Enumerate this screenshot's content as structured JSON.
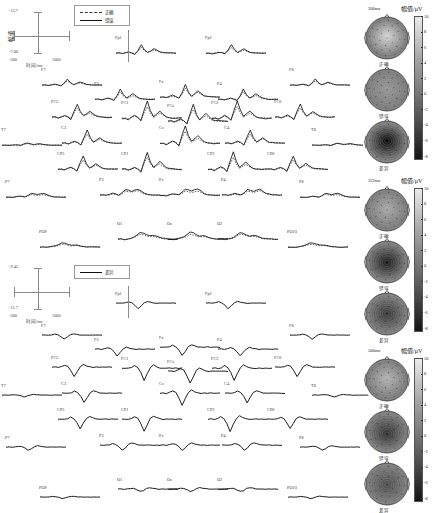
{
  "figure": {
    "type": "erp-grand-average-with-topomaps"
  },
  "blocks": [
    {
      "id": "upper",
      "axis": {
        "y_max": "+13.7",
        "y_min": "-7.00",
        "x_min": "-200",
        "x_max": "1000",
        "y_axis_label": "幅值",
        "x_axis_label": "时间/ms"
      },
      "legend": [
        {
          "style": "dashed",
          "label": "正确"
        },
        {
          "style": "solid",
          "label": "错误"
        }
      ]
    },
    {
      "id": "lower",
      "axis": {
        "y_max": "+9.45",
        "y_min": "-11.7",
        "x_min": "-200",
        "x_max": "1000",
        "y_axis_label": "幅值",
        "x_axis_label": "时间/ms"
      },
      "legend": [
        {
          "style": "solid",
          "label": "差异"
        }
      ]
    }
  ],
  "electrodes": [
    "Fp1",
    "Fp2",
    "F7",
    "F3",
    "Fz",
    "F4",
    "F8",
    "FC5",
    "FC1",
    "FCz",
    "FC2",
    "FC6",
    "T7",
    "C3",
    "Cz",
    "C4",
    "T8",
    "CP5",
    "CP1",
    "CP2",
    "CP6",
    "P7",
    "P3",
    "Pz",
    "P4",
    "P8",
    "PO9",
    "O1",
    "Oz",
    "O2",
    "PO10"
  ],
  "topo_groups": [
    {
      "time": "200ms",
      "rows": [
        "正确",
        "错误",
        "差异"
      ],
      "colorbar": {
        "title": "幅值/μV",
        "ticks": [
          "10",
          "8",
          "6",
          "4",
          "2",
          "0",
          "-2",
          "-4",
          "-6",
          "-8"
        ],
        "max": 10,
        "min": -8
      }
    },
    {
      "time": "352ms",
      "rows": [
        "正确",
        "错误",
        "差异"
      ],
      "colorbar": {
        "title": "幅值/μV",
        "ticks": [
          "10",
          "8",
          "6",
          "4",
          "2",
          "0",
          "-2",
          "-4",
          "-6",
          "-8"
        ],
        "max": 10,
        "min": -8
      }
    },
    {
      "time": "500ms",
      "rows": [
        "正确",
        "错误",
        "差异"
      ],
      "colorbar": {
        "title": "幅值/μV",
        "ticks": [
          "10",
          "8",
          "6",
          "4",
          "2",
          "0",
          "-2",
          "-4",
          "-6",
          "-8"
        ],
        "max": 10,
        "min": -8
      }
    }
  ],
  "colors": {
    "correct_trace": "#3a3a3a",
    "error_trace": "#111111",
    "difference_trace": "#111111",
    "axis": "#8a8a8a"
  },
  "chart_data": {
    "type": "line",
    "title": "",
    "xlabel": "时间/ms",
    "ylabel": "幅值/μV",
    "xlim": [
      -200,
      1000
    ],
    "series": [
      {
        "name": "正确",
        "style": "dashed"
      },
      {
        "name": "错误",
        "style": "solid"
      },
      {
        "name": "差异",
        "style": "solid"
      }
    ],
    "waveform_upper": {
      "ylim": [
        -7.0,
        13.7
      ],
      "correct": [
        0,
        0.1,
        -0.2,
        0.2,
        1.0,
        0.4,
        -0.3,
        2.2,
        5.5,
        3.0,
        1.2,
        2.0,
        3.4,
        2.2,
        1.0,
        0.6,
        0.3,
        0.1,
        0,
        0.1
      ],
      "error": [
        0,
        0.2,
        -0.4,
        0.3,
        1.6,
        0.5,
        -0.6,
        3.4,
        8.6,
        4.2,
        1.4,
        2.6,
        4.2,
        2.6,
        1.1,
        0.6,
        0.3,
        0.1,
        0,
        0.1
      ]
    },
    "waveform_lower": {
      "ylim": [
        -11.7,
        9.45
      ],
      "difference": [
        0,
        0.2,
        -0.1,
        0.4,
        1.6,
        0.2,
        -3.0,
        -8.6,
        -4.0,
        0.2,
        2.2,
        1.0,
        0.2,
        -0.2,
        0,
        0.1,
        0,
        0,
        0,
        0
      ]
    }
  }
}
